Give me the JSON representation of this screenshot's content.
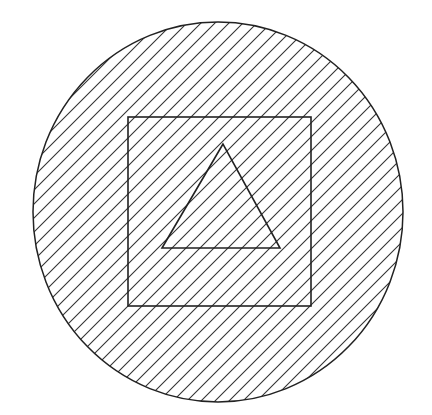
{
  "diagram": {
    "colors": {
      "background": "#ffffff",
      "stroke": "#222222",
      "hatch": "#333333"
    },
    "circle": {
      "cx": 218,
      "cy": 212,
      "rx": 185,
      "ry": 190,
      "fill": "diagonal-hatch"
    },
    "square": {
      "x": 128,
      "y": 117,
      "width": 183,
      "height": 189
    },
    "triangle": {
      "points": [
        [
          223,
          144
        ],
        [
          162,
          248
        ],
        [
          280,
          248
        ]
      ]
    },
    "hatch": {
      "angle_deg": 45,
      "spacing_px": 14,
      "direction": "up-right"
    }
  }
}
